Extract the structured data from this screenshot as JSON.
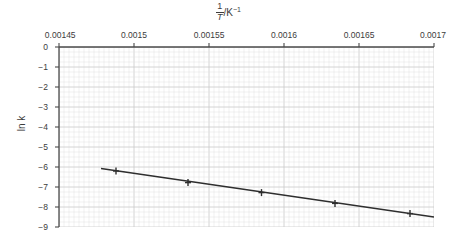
{
  "chart_data": {
    "type": "scatter",
    "title_parts": {
      "numerator": "1",
      "denominator": "T",
      "unit": "/K",
      "unit_exponent": "−1"
    },
    "xlabel": "1/T /K⁻¹",
    "ylabel": "ln k",
    "xlim": [
      0.00145,
      0.0017
    ],
    "ylim": [
      -9,
      0
    ],
    "xticks": [
      "0.00145",
      "0.0015",
      "0.00155",
      "0.0016",
      "0.00165",
      "0.0017"
    ],
    "xtick_values": [
      0.00145,
      0.0015,
      0.00155,
      0.0016,
      0.00165,
      0.0017
    ],
    "yticks": [
      "0",
      "−1",
      "−2",
      "−3",
      "−4",
      "−5",
      "−6",
      "−7",
      "−8",
      "−9"
    ],
    "ytick_values": [
      0,
      -1,
      -2,
      -3,
      -4,
      -5,
      -6,
      -7,
      -8,
      -9
    ],
    "grid": true,
    "grid_style": "graph-paper-minor-and-major",
    "legend": "none",
    "x": [
      0.001488,
      0.001536,
      0.001585,
      0.001634,
      0.001684
    ],
    "y": [
      -6.2,
      -6.78,
      -7.28,
      -7.82,
      -8.33
    ],
    "series": [
      {
        "name": "ln k vs 1/T",
        "marker": "plus",
        "x": [
          0.001488,
          0.001536,
          0.001585,
          0.001634,
          0.001684
        ],
        "values": [
          -6.2,
          -6.78,
          -7.28,
          -7.82,
          -8.33
        ]
      }
    ],
    "trendline": {
      "type": "line",
      "x_start": 0.001478,
      "y_start": -6.07,
      "x_end": 0.0017,
      "y_end": -8.5
    },
    "colors": {
      "line": "#2e2e2e",
      "marker": "#2e2e2e",
      "axis": "#4a4a4a",
      "grid_minor": "#e2e2e2",
      "grid_major": "#c9c9c9",
      "text": "#3c3c3c",
      "background": "#ffffff"
    }
  }
}
